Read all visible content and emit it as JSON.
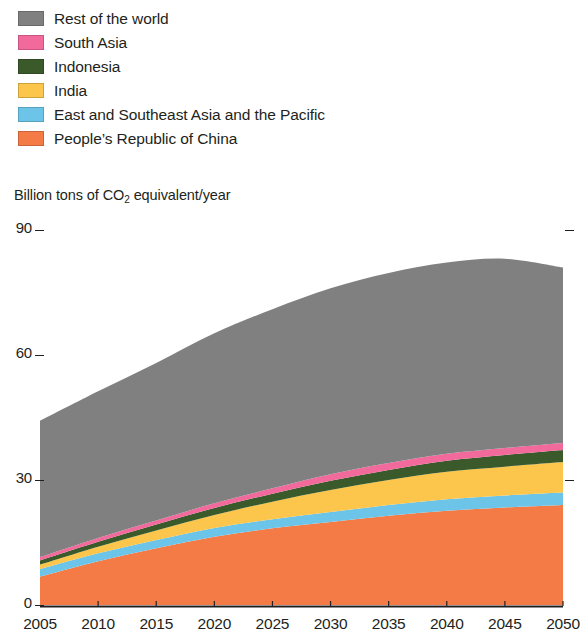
{
  "legend": {
    "position": "top-left",
    "items": [
      {
        "label": "Rest of the world",
        "color": "#808080",
        "key": "rest-of-the-world"
      },
      {
        "label": "South Asia",
        "color": "#F2699C",
        "key": "south-asia"
      },
      {
        "label": "Indonesia",
        "color": "#3B5A2B",
        "key": "indonesia"
      },
      {
        "label": "India",
        "color": "#FBC64B",
        "key": "india"
      },
      {
        "label": "East and Southeast Asia and the Pacific",
        "color": "#6CC5E8",
        "key": "east-and-southeast-asia-and-the-pacific"
      },
      {
        "label": "People’s Republic of China",
        "color": "#F47B46",
        "key": "peoples-republic-of-china"
      }
    ]
  },
  "axis_title": {
    "prefix": "Billion tons of CO",
    "subscript": "2",
    "suffix": " equivalent/year"
  },
  "chart_data": {
    "type": "area",
    "stacked": true,
    "title": "",
    "subtitle": "",
    "xlabel": "",
    "ylabel": "Billion tons of CO2 equivalent/year",
    "xlim": [
      2005,
      2050
    ],
    "ylim": [
      0,
      90
    ],
    "yticks": [
      0,
      30,
      60,
      90
    ],
    "ytick_labels": [
      "0",
      "30",
      "60",
      "90"
    ],
    "xticks": [
      2005,
      2010,
      2015,
      2020,
      2025,
      2030,
      2035,
      2040,
      2045,
      2050
    ],
    "xtick_labels": [
      "2005",
      "2010",
      "2015",
      "2020",
      "2025",
      "2030",
      "2035",
      "2040",
      "2045",
      "2050"
    ],
    "grid": false,
    "legend_position": "above-plot",
    "x": [
      2005,
      2010,
      2015,
      2020,
      2025,
      2030,
      2035,
      2040,
      2045,
      2050
    ],
    "series": [
      {
        "name": "People’s Republic of China",
        "color": "#F47B46",
        "values": [
          6.8,
          10.5,
          13.6,
          16.4,
          18.4,
          19.9,
          21.4,
          22.6,
          23.4,
          24.0
        ]
      },
      {
        "name": "East and Southeast Asia and the Pacific",
        "color": "#6CC5E8",
        "values": [
          1.8,
          1.9,
          2.0,
          2.1,
          2.2,
          2.4,
          2.6,
          2.8,
          2.9,
          3.0
        ]
      },
      {
        "name": "India",
        "color": "#FBC64B",
        "values": [
          1.1,
          1.6,
          2.3,
          3.1,
          4.2,
          5.3,
          6.0,
          6.6,
          6.9,
          7.3
        ]
      },
      {
        "name": "Indonesia",
        "color": "#3B5A2B",
        "values": [
          1.0,
          1.2,
          1.4,
          1.7,
          1.9,
          2.2,
          2.4,
          2.6,
          2.8,
          2.9
        ]
      },
      {
        "name": "South Asia",
        "color": "#F2699C",
        "values": [
          0.8,
          0.9,
          1.0,
          1.1,
          1.3,
          1.6,
          1.7,
          1.7,
          1.7,
          1.7
        ]
      },
      {
        "name": "Rest of the world",
        "color": "#808080",
        "values": [
          32.7,
          35.2,
          37.8,
          40.8,
          43.0,
          44.6,
          45.6,
          45.9,
          45.4,
          42.1
        ]
      }
    ],
    "totals": [
      44.2,
      51.3,
      58.1,
      65.2,
      71.0,
      76.0,
      79.7,
      82.2,
      83.1,
      81.0
    ]
  }
}
